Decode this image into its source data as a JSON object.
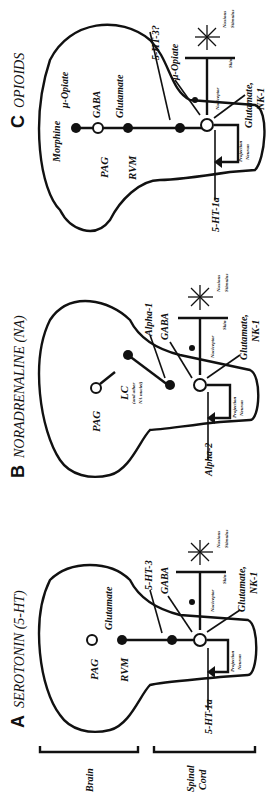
{
  "figure": {
    "orientation": "rotated 90 degrees counterclockwise",
    "panels": [
      {
        "letter": "A",
        "title": "SEROTONIN (5-HT)",
        "labels": {
          "pag": "PAG",
          "rvm": "RVM",
          "glutamate_top": "Glutamate",
          "receptor_1": "5-HT-3",
          "gaba": "GABA",
          "glutamate_nk1": "Glutamate,",
          "nk1": "NK-1",
          "receptor_2": "5-HT-1a",
          "nociceptor": "Nociceptor",
          "skin": "Skin",
          "noxious": "Noxious",
          "stimulus": "Stimulus",
          "projection": "Projection",
          "neuron": "Neuron"
        }
      },
      {
        "letter": "B",
        "title": "NORADRENALINE (NA)",
        "labels": {
          "pag": "PAG",
          "lc": "LC",
          "lc_sub1": "(and other",
          "lc_sub2": "NA nuclei)",
          "receptor_1": "Alpha-1",
          "gaba": "GABA",
          "glutamate_nk1": "Glutamate,",
          "nk1": "NK-1",
          "receptor_2": "Alpha-2",
          "nociceptor": "Nociceptor",
          "skin": "Skin",
          "noxious": "Noxious",
          "stimulus": "Stimulus",
          "projection": "Projection",
          "neuron": "Neuron"
        }
      },
      {
        "letter": "C",
        "title": "OPIOIDS",
        "labels": {
          "morphine": "Morphine",
          "mu_opiate_top": "μ-Opiate",
          "gaba_top": "GABA",
          "glutamate_top": "Glutamate",
          "pag": "PAG",
          "rvm": "RVM",
          "receptor_1": "5-HT-3?",
          "mu_opiate_2": "μ-Opiate",
          "glutamate_nk1": "Glutamate,",
          "nk1": "NK-1",
          "receptor_2": "5-HT-1a",
          "nociceptor": "Nociceptor",
          "skin": "Skin",
          "noxious": "Noxious",
          "stimulus": "Stimulus",
          "projection": "Projection",
          "neuron": "Neuron"
        }
      }
    ],
    "brackets": {
      "brain": "Brain",
      "spinal_1": "Spinal",
      "spinal_2": "Cord"
    },
    "signs": {
      "plus": "+",
      "minus": "-"
    }
  }
}
